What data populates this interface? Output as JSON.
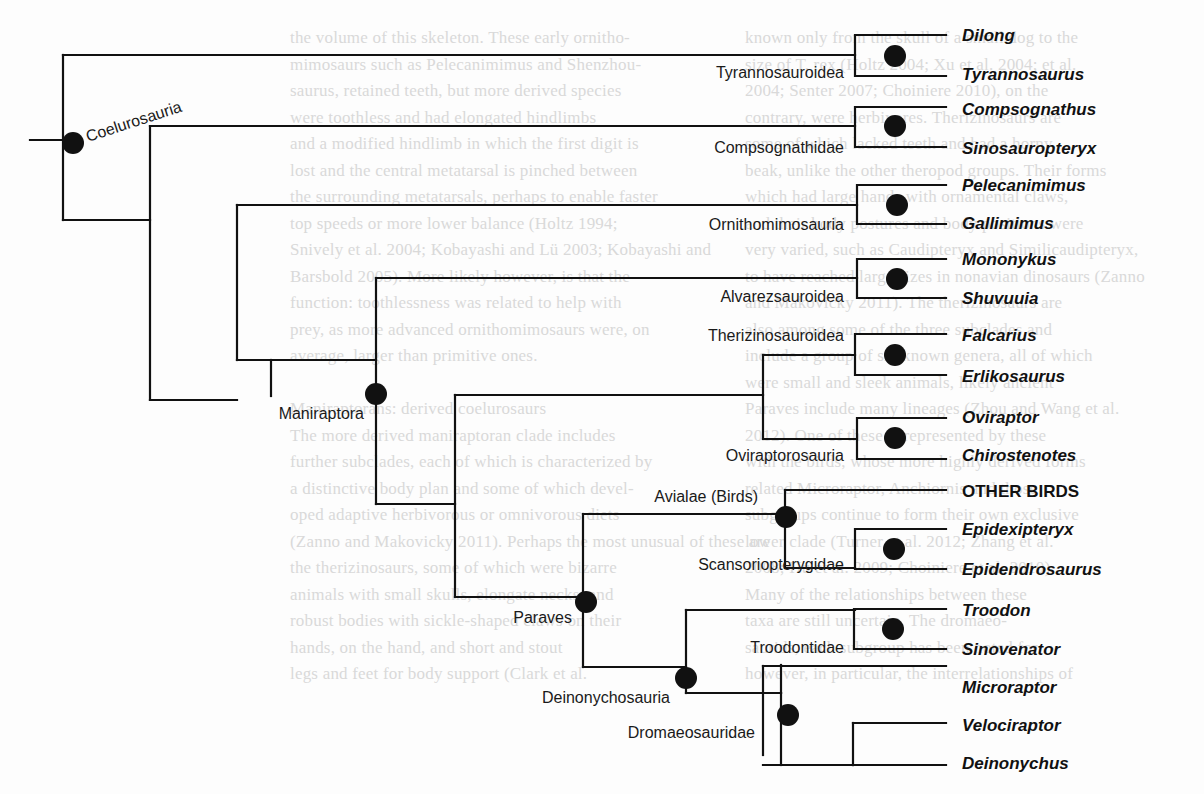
{
  "colors": {
    "line": "#111111",
    "node": "#111111",
    "background_text": "#d9d9d9"
  },
  "background_text": {
    "left_column": [
      "the volume of this skeleton. These early ornitho-",
      "mimosaurs such as Pelecanimimus and Shenzhou-",
      "saurus, retained teeth, but more derived species",
      "were toothless and had elongated hindlimbs",
      "and a modified hindlimb in which the first digit is",
      "lost and the central metatarsal is pinched between",
      "the surrounding metatarsals, perhaps to enable faster",
      "top speeds or more lower balance (Holtz 1994;",
      "Snively et al. 2004; Kobayashi and Lü 2003; Kobayashi and",
      "Barsbold 2005). More likely however, is that the",
      "function: toothlessness was related to help with",
      "prey, as more advanced ornithomimosaurs were, on",
      "average, larger than primitive ones.",
      "",
      "Maniraptorans: derived coelurosaurs",
      "The more derived maniraptoran clade includes",
      "further subclades, each of which is characterized by",
      "a distinctive body plan and some of which devel-",
      "oped adaptive herbivorous or omnivorous diets",
      "(Zanno and Makovicky 2011). Perhaps the most unusual of these are",
      "the therizinosaurs, some of which were bizarre",
      "animals with small skulls, elongate necks, and",
      "robust bodies with sickle-shaped claws on their",
      "hands, on the hand, and short and stout",
      "legs and feet for body support (Clark et al."
    ],
    "right_column": [
      "known only from the skull of a small dog to the",
      "size of T. rex (Holtz 2004; Xu et al. 2004; et al.",
      "2004; Senter 2007; Choiniere 2010), on the",
      "contrary, were herbivores. Therizinosaurs are",
      "some of which lacked teeth and had a horny",
      "beak, unlike the other theropod groups. Their forms",
      "which had large hands with ornamental claws,",
      "and their body postures and body positions were",
      "very varied, such as Caudipteryx and Similicaudipteryx,",
      "to have reached large sizes in nonavian dinosaurs (Zanno",
      "and Makovicky 2011). The therizinosaurs are",
      "also among some of the three subclades and",
      "include a group of six known genera, all of which",
      "were small and sleek animals, likely ancient",
      "Paraves include many lineages (Zhou and Wang et al.",
      "2012). One of these is represented by these",
      "with the birds, whose more highly derived forms",
      "related Microraptor, Anchiornis and those",
      "subgroups continue to form their own exclusive",
      "lower clade (Turner et al. 2012; Zhang et al.",
      "2008; Hu et al. 2009; Choiniere et al. 2010).",
      "Many of the relationships between these",
      "taxa are still uncertain. The dromaeo-",
      "saurids, each subgroup has been noted for",
      "however, in particular, the interrelationships of"
    ]
  },
  "chart_data": {
    "type": "tree",
    "title": "",
    "root": {
      "name": "Coelurosauria",
      "children": [
        {
          "name": "Tyrannosauroidea",
          "children": [
            "Dilong",
            "Tyrannosaurus"
          ]
        },
        {
          "name": "",
          "children": [
            {
              "name": "Compsognathidae",
              "children": [
                "Compsognathus",
                "Sinosauropteryx"
              ]
            },
            {
              "name": "",
              "children": [
                {
                  "name": "Ornithomimosauria",
                  "children": [
                    "Pelecanimimus",
                    "Gallimimus"
                  ]
                },
                {
                  "name": "Maniraptora",
                  "children": [
                    {
                      "name": "Alvarezsauroidea",
                      "children": [
                        "Mononykus",
                        "Shuvuuia"
                      ]
                    },
                    {
                      "name": "",
                      "children": [
                        {
                          "name": "",
                          "children": [
                            {
                              "name": "Therizinosauroidea",
                              "children": [
                                "Falcarius",
                                "Erlikosaurus"
                              ]
                            },
                            {
                              "name": "Oviraptorosauria",
                              "children": [
                                "Oviraptor",
                                "Chirostenotes"
                              ]
                            }
                          ]
                        },
                        {
                          "name": "Paraves",
                          "children": [
                            {
                              "name": "Avialae (Birds)",
                              "children": [
                                "OTHER BIRDS",
                                {
                                  "name": "Scansoriopterygidae",
                                  "children": [
                                    "Epidexipteryx",
                                    "Epidendrosaurus"
                                  ]
                                }
                              ]
                            },
                            {
                              "name": "Deinonychosauria",
                              "children": [
                                {
                                  "name": "Troodontidae",
                                  "children": [
                                    "Troodon",
                                    "Sinovenator"
                                  ]
                                },
                                {
                                  "name": "Dromaeosauridae",
                                  "children": [
                                    "Microraptor",
                                    {
                                      "name": "",
                                      "children": [
                                        "Velociraptor",
                                        "Deinonychus"
                                      ]
                                    }
                                  ]
                                }
                              ]
                            }
                          ]
                        }
                      ]
                    }
                  ]
                }
              ]
            }
          ]
        }
      ]
    },
    "taxa": [
      "Dilong",
      "Tyrannosaurus",
      "Compsognathus",
      "Sinosauropteryx",
      "Pelecanimimus",
      "Gallimimus",
      "Mononykus",
      "Shuvuuia",
      "Falcarius",
      "Erlikosaurus",
      "Oviraptor",
      "Chirostenotes",
      "OTHER BIRDS",
      "Epidexipteryx",
      "Epidendrosaurus",
      "Troodon",
      "Sinovenator",
      "Microraptor",
      "Velociraptor",
      "Deinonychus"
    ],
    "clade_labels": [
      "Coelurosauria",
      "Tyrannosauroidea",
      "Compsognathidae",
      "Ornithomimosauria",
      "Maniraptora",
      "Alvarezsauroidea",
      "Therizinosauroidea",
      "Oviraptorosauria",
      "Avialae (Birds)",
      "Paraves",
      "Scansoriopterygidae",
      "Deinonychosauria",
      "Troodontidae",
      "Dromaeosauridae"
    ]
  },
  "labels": {
    "clades": {
      "coelurosauria": "Coelurosauria",
      "tyrannosauroidea": "Tyrannosauroidea",
      "compsognathidae": "Compsognathidae",
      "ornithomimosauria": "Ornithomimosauria",
      "maniraptora": "Maniraptora",
      "alvarezsauroidea": "Alvarezsauroidea",
      "therizinosauroidea": "Therizinosauroidea",
      "oviraptorosauria": "Oviraptorosauria",
      "avialae": "Avialae (Birds)",
      "paraves": "Paraves",
      "scansoriopterygidae": "Scansoriopterygidae",
      "deinonychosauria": "Deinonychosauria",
      "troodontidae": "Troodontidae",
      "dromaeosauridae": "Dromaeosauridae"
    },
    "taxa": {
      "dilong": "Dilong",
      "tyrannosaurus": "Tyrannosaurus",
      "compsognathus": "Compsognathus",
      "sinosauropteryx": "Sinosauropteryx",
      "pelecanimimus": "Pelecanimimus",
      "gallimimus": "Gallimimus",
      "mononykus": "Mononykus",
      "shuvuuia": "Shuvuuia",
      "falcarius": "Falcarius",
      "erlikosaurus": "Erlikosaurus",
      "oviraptor": "Oviraptor",
      "chirostenotes": "Chirostenotes",
      "other_birds": "OTHER BIRDS",
      "epidexipteryx": "Epidexipteryx",
      "epidendrosaurus": "Epidendrosaurus",
      "troodon": "Troodon",
      "sinovenator": "Sinovenator",
      "microraptor": "Microraptor",
      "velociraptor": "Velociraptor",
      "deinonychus": "Deinonychus"
    }
  }
}
